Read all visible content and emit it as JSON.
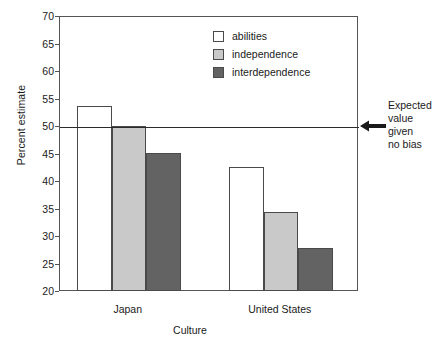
{
  "chart_data": {
    "type": "bar",
    "title": "",
    "subtitle": "",
    "xlabel": "Culture",
    "ylabel": "Percent estimate",
    "categories": [
      "Japan",
      "United States"
    ],
    "series": [
      {
        "name": "abilities",
        "color": "#ffffff",
        "values": [
          53.8,
          42.7
        ]
      },
      {
        "name": "independence",
        "color": "#c9c9c9",
        "values": [
          50.2,
          34.6
        ]
      },
      {
        "name": "interdependence",
        "color": "#636363",
        "values": [
          45.2,
          28.0
        ]
      }
    ],
    "ylim": [
      20,
      70
    ],
    "yticks": [
      20,
      25,
      30,
      35,
      40,
      45,
      50,
      55,
      60,
      65,
      70
    ],
    "ytick_labels": [
      "20",
      "25",
      "30",
      "35",
      "40",
      "45",
      "50",
      "55",
      "60",
      "65",
      "70"
    ],
    "grid": false,
    "legend_position": "top-center",
    "reference_line": {
      "value": 50,
      "label_lines": [
        "Expected",
        "value",
        "given",
        "no bias"
      ],
      "arrow": "left-arrow-icon"
    },
    "bar_edge_color": "#4a4a4a",
    "axis_color": "#555555"
  },
  "legend": {
    "items": [
      {
        "label": "abilities"
      },
      {
        "label": "independence"
      },
      {
        "label": "interdependence"
      }
    ]
  },
  "annotation": {
    "line1": "Expected",
    "line2": "value",
    "line3": "given",
    "line4": "no bias"
  },
  "axes": {
    "x_title": "Culture",
    "y_title": "Percent estimate",
    "group_labels": [
      "Japan",
      "United States"
    ]
  }
}
